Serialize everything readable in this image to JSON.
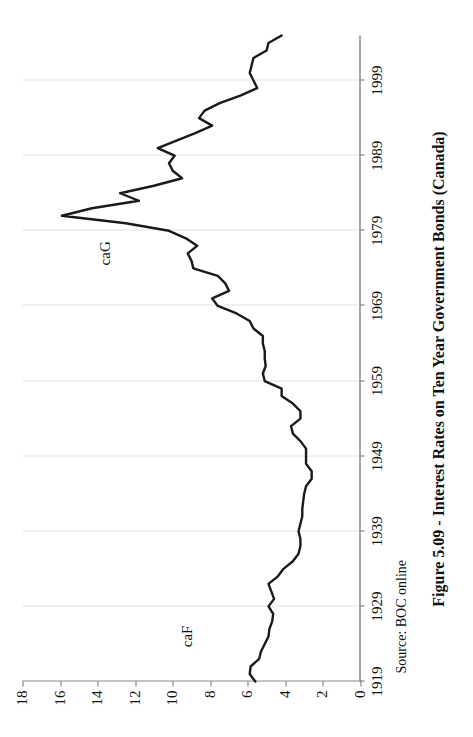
{
  "figure": {
    "title": "Figure 5.09 - Interest Rates on Ten Year Government Bonds (Canada)",
    "source_note": "Source: BOC online"
  },
  "chart_data": {
    "type": "line",
    "title": "Figure 5.09 - Interest Rates on Ten Year Government Bonds (Canada)",
    "xlabel": "",
    "ylabel": "",
    "xlim": [
      1919,
      2005
    ],
    "ylim": [
      0,
      18
    ],
    "grid": true,
    "legend_position": "inline-annotation",
    "orientation": "rotated-90-ccw",
    "yticks": [
      0,
      2,
      4,
      6,
      8,
      10,
      12,
      14,
      16,
      18
    ],
    "ytick_labels": [
      "0",
      "2",
      "4",
      "6",
      "8",
      "10",
      "12",
      "14",
      "16",
      "18"
    ],
    "xticks": [
      1919,
      1929,
      1939,
      1949,
      1959,
      1969,
      1979,
      1989,
      1999
    ],
    "xtick_labels": [
      "1919",
      "1929",
      "1939",
      "1949",
      "1959",
      "1969",
      "1979",
      "1989",
      "1999"
    ],
    "annotations": [
      {
        "text": "caG",
        "x": 1976,
        "y": 13.6
      },
      {
        "text": "caF",
        "x": 1925,
        "y": 9.2
      }
    ],
    "series": [
      {
        "name": "caG",
        "color": "#1a1a1a",
        "x": [
          1919,
          1920,
          1921,
          1922,
          1923,
          1924,
          1925,
          1926,
          1927,
          1928,
          1929,
          1930,
          1931,
          1932,
          1933,
          1934,
          1935,
          1936,
          1937,
          1938,
          1939,
          1940,
          1941,
          1942,
          1943,
          1944,
          1945,
          1946,
          1947,
          1948,
          1949,
          1950,
          1951,
          1952,
          1953,
          1954,
          1955,
          1956,
          1957,
          1958,
          1959,
          1960,
          1961,
          1962,
          1963,
          1964,
          1965,
          1966,
          1967,
          1968,
          1969,
          1970,
          1971,
          1972,
          1973,
          1974,
          1975,
          1976,
          1977,
          1978,
          1979,
          1980,
          1981,
          1982,
          1983,
          1984,
          1985,
          1986,
          1987,
          1988,
          1989,
          1990,
          1991,
          1992,
          1993,
          1994,
          1995,
          1996,
          1997,
          1998,
          1999,
          2000,
          2001,
          2002,
          2003,
          2004,
          2005
        ],
        "y": [
          5.6,
          5.9,
          5.85,
          5.4,
          5.3,
          5.1,
          4.9,
          4.85,
          4.7,
          4.65,
          4.9,
          4.6,
          4.75,
          4.9,
          4.4,
          4.1,
          3.6,
          3.3,
          3.2,
          3.2,
          3.3,
          3.2,
          3.1,
          3.1,
          3.05,
          3.0,
          2.9,
          2.6,
          2.6,
          2.9,
          2.9,
          2.9,
          3.2,
          3.6,
          3.7,
          3.2,
          3.2,
          3.6,
          4.2,
          4.2,
          5.1,
          5.2,
          5.05,
          5.1,
          5.1,
          5.2,
          5.2,
          5.7,
          5.9,
          6.6,
          7.6,
          7.9,
          7.0,
          7.2,
          7.6,
          8.9,
          9.0,
          9.2,
          8.7,
          9.3,
          10.2,
          12.5,
          15.9,
          14.3,
          11.8,
          12.8,
          11.0,
          9.5,
          10.0,
          10.2,
          9.9,
          10.8,
          9.8,
          8.8,
          7.9,
          8.6,
          8.3,
          7.5,
          6.4,
          5.5,
          5.7,
          5.9,
          5.8,
          5.7,
          5.0,
          4.9,
          4.2
        ]
      }
    ]
  }
}
